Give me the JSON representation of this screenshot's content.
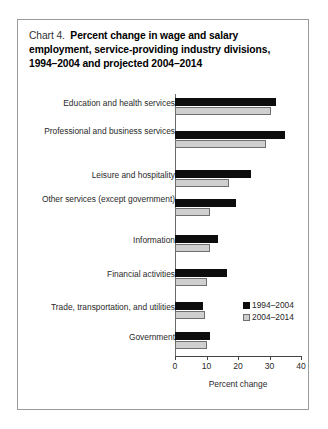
{
  "figure": {
    "title_lead": "Chart 4.",
    "title_main": "Percent change in wage and salary employment, service-providing industry divisions, 1994–2004 and projected 2004–2014"
  },
  "chart_data": {
    "type": "bar",
    "orientation": "horizontal",
    "xlabel": "Percent change",
    "ylabel": "",
    "xlim": [
      0,
      40
    ],
    "xticks": [
      0,
      10,
      20,
      30,
      40
    ],
    "xtick_labels": [
      "0",
      "10",
      "20",
      "30",
      "40"
    ],
    "grid": false,
    "legend_position": "inside-lower-right",
    "categories": [
      "Education and health services",
      "Professional and business services",
      "Leisure and hospitality",
      "Other services (except government)",
      "Information",
      "Financial activities",
      "Trade, transportation, and utilities",
      "Government"
    ],
    "series": [
      {
        "name": "1994–2004",
        "color": "#0d0d0d",
        "values": [
          32.0,
          35.0,
          24.0,
          19.5,
          13.5,
          16.5,
          9.0,
          11.0
        ]
      },
      {
        "name": "2004–2014",
        "color": "#cfcfcf",
        "values": [
          30.5,
          29.0,
          17.0,
          11.0,
          11.0,
          10.0,
          9.5,
          10.0
        ]
      }
    ]
  }
}
